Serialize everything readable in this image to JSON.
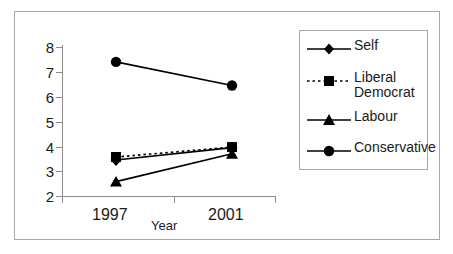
{
  "chart_data": {
    "type": "line",
    "title": "",
    "subtitle": "",
    "xlabel": "Year",
    "ylabel": "",
    "categories": [
      "1997",
      "2001"
    ],
    "x_tick_labels": [
      "1997",
      "2001"
    ],
    "y_tick_labels": [
      "2",
      "3",
      "4",
      "5",
      "6",
      "7",
      "8"
    ],
    "ylim": [
      2,
      8
    ],
    "y_ticks": [
      2,
      3,
      4,
      5,
      6,
      7,
      8
    ],
    "grid": false,
    "legend_position": "right",
    "series": [
      {
        "name": "Self",
        "values": [
          3.45,
          3.95
        ],
        "marker": "diamond",
        "line_style": "solid",
        "color": "#000000"
      },
      {
        "name": "Liberal Democrat",
        "values": [
          3.57,
          3.97
        ],
        "marker": "square",
        "line_style": "dotted",
        "color": "#000000"
      },
      {
        "name": "Labour",
        "values": [
          2.58,
          3.7
        ],
        "marker": "triangle",
        "line_style": "solid",
        "color": "#000000"
      },
      {
        "name": "Conservative",
        "values": [
          7.4,
          6.45
        ],
        "marker": "circle",
        "line_style": "solid",
        "color": "#000000"
      }
    ]
  },
  "axes": {
    "y_ticks": [
      {
        "label": "8"
      },
      {
        "label": "7"
      },
      {
        "label": "6"
      },
      {
        "label": "5"
      },
      {
        "label": "4"
      },
      {
        "label": "3"
      },
      {
        "label": "2"
      }
    ],
    "x_ticks": [
      {
        "label": "1997"
      },
      {
        "label": "2001"
      }
    ],
    "x_title": "Year"
  },
  "legend": {
    "entries": [
      {
        "label": "Self",
        "marker": "diamond-icon",
        "line_style": "solid"
      },
      {
        "label": "Liberal\nDemocrat",
        "marker": "square-icon",
        "line_style": "dotted"
      },
      {
        "label": "Labour",
        "marker": "triangle-icon",
        "line_style": "solid"
      },
      {
        "label": "Conservative",
        "marker": "circle-icon",
        "line_style": "solid"
      }
    ]
  },
  "colors": {
    "ink": "#000000",
    "axis": "#8c8c8c",
    "frame": "#a8a8a8",
    "background": "#ffffff"
  }
}
